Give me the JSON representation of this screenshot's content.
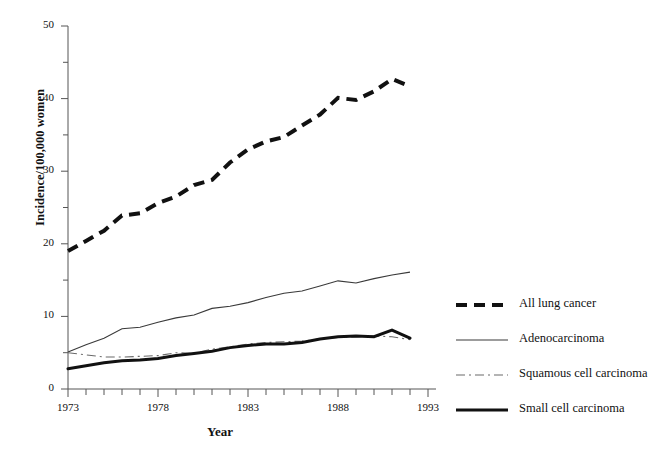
{
  "chart_data": {
    "type": "line",
    "title": "",
    "xlabel": "Year",
    "ylabel": "Incidence/100,000 women",
    "xlim": [
      1973,
      1993
    ],
    "ylim": [
      0,
      50
    ],
    "grid": false,
    "legend_position": "right",
    "x": [
      1973,
      1974,
      1975,
      1976,
      1977,
      1978,
      1979,
      1980,
      1981,
      1982,
      1983,
      1984,
      1985,
      1986,
      1987,
      1988,
      1989,
      1990,
      1991,
      1992
    ],
    "xticks_major": [
      1973,
      1978,
      1983,
      1988,
      1993
    ],
    "xtick_labels": [
      "1973",
      "1978",
      "1983",
      "1988",
      "1993"
    ],
    "yticks_major": [
      0,
      10,
      20,
      30,
      40,
      50
    ],
    "ytick_labels": [
      "0",
      "10",
      "20",
      "30",
      "40",
      "50"
    ],
    "yticks_minor": [
      5,
      15,
      25,
      35,
      45
    ],
    "series": [
      {
        "name": "All lung cancer",
        "style": "thick-dashed",
        "color": "#111111",
        "values": [
          19.0,
          20.4,
          21.8,
          23.9,
          24.2,
          25.6,
          26.5,
          28.1,
          28.8,
          31.2,
          33.0,
          34.1,
          34.7,
          36.3,
          37.8,
          40.1,
          39.8,
          41.0,
          42.7,
          41.7
        ]
      },
      {
        "name": "Adenocarcinoma",
        "style": "thin-solid",
        "color": "#3a3a3a",
        "values": [
          5.1,
          6.1,
          7.0,
          8.3,
          8.5,
          9.2,
          9.8,
          10.2,
          11.1,
          11.4,
          11.9,
          12.6,
          13.2,
          13.5,
          14.2,
          14.9,
          14.6,
          15.2,
          15.7,
          16.1
        ]
      },
      {
        "name": "Squamous cell carcinoma",
        "style": "thin-dashdot",
        "color": "#6a6a6a",
        "values": [
          5.0,
          4.7,
          4.4,
          4.4,
          4.5,
          4.6,
          5.0,
          4.9,
          5.5,
          5.8,
          6.2,
          6.4,
          6.5,
          6.6,
          6.9,
          7.1,
          7.2,
          7.3,
          7.2,
          6.8
        ]
      },
      {
        "name": "Small cell carcinoma",
        "style": "thick-solid",
        "color": "#111111",
        "values": [
          2.8,
          3.2,
          3.6,
          3.9,
          4.0,
          4.2,
          4.6,
          4.9,
          5.2,
          5.7,
          6.0,
          6.2,
          6.2,
          6.4,
          6.9,
          7.2,
          7.3,
          7.2,
          8.1,
          7.0
        ]
      }
    ]
  },
  "legend": {
    "items": [
      {
        "label": "All lung cancer",
        "key": "thick-dashed"
      },
      {
        "label": "Adenocarcinoma",
        "key": "thin-solid"
      },
      {
        "label": "Squamous cell carcinoma",
        "key": "thin-dashdot"
      },
      {
        "label": "Small cell carcinoma",
        "key": "thick-solid"
      }
    ]
  }
}
